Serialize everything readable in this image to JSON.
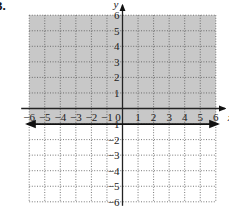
{
  "problem": {
    "number_label": "3."
  },
  "chart_data": {
    "type": "inequality-graph",
    "title": "",
    "xlabel": "x",
    "ylabel": "y",
    "xlim": [
      -6,
      6
    ],
    "ylim": [
      -6,
      6
    ],
    "grid": true,
    "grid_style": "dotted",
    "x_ticks": [
      -6,
      -5,
      -4,
      -3,
      -2,
      -1,
      0,
      1,
      2,
      3,
      4,
      5,
      6
    ],
    "x_tick_labels": [
      "−6",
      "−5",
      "−4",
      "−3",
      "−2",
      "−1",
      "0",
      "1",
      "2",
      "3",
      "4",
      "5",
      "6"
    ],
    "y_ticks": [
      6,
      5,
      4,
      3,
      2,
      1,
      -1,
      -2,
      -3,
      -4,
      -5,
      -6
    ],
    "y_tick_labels": [
      "6",
      "5",
      "4",
      "3",
      "2",
      "1",
      "−1",
      "−2",
      "−3",
      "−4",
      "−5",
      "−6"
    ],
    "boundary": {
      "equation": "y = -1",
      "y": -1,
      "style": "solid",
      "arrows": "both"
    },
    "inequality": "y ≥ -1",
    "shaded_region": {
      "from_y": -1,
      "to_y": 6,
      "from_x": -6,
      "to_x": 6
    },
    "colors": {
      "shade": "#c8c8c8",
      "grid": "#555555",
      "axis": "#222222",
      "boundary": "#111111",
      "background": "#ffffff"
    }
  }
}
